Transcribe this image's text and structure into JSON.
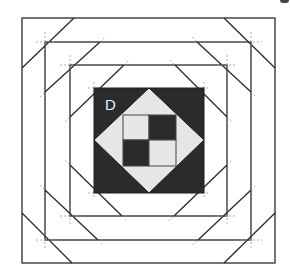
{
  "diagram": {
    "block_label": "D",
    "colors": {
      "background": "#ffffff",
      "line": "#2a2a2a",
      "dark_fabric": "#2b2b2b",
      "light_fabric": "#e6e6e6",
      "guide": "#8a8a8a"
    },
    "center": {
      "x": 149,
      "y": 140
    },
    "squares": [
      {
        "name": "outer-border",
        "left": 22,
        "top": 18,
        "right": 275,
        "bottom": 263
      },
      {
        "name": "second-border",
        "left": 45,
        "top": 42,
        "right": 251,
        "bottom": 240
      },
      {
        "name": "third-border",
        "left": 70,
        "top": 65,
        "right": 227,
        "bottom": 216
      },
      {
        "name": "dark-center-square",
        "left": 94,
        "top": 88,
        "right": 204,
        "bottom": 193
      }
    ],
    "diamond": {
      "top": [
        149,
        88
      ],
      "right": [
        204,
        140
      ],
      "bottom": [
        149,
        193
      ],
      "left": [
        94,
        140
      ]
    },
    "four_patch": {
      "left": 123,
      "top": 115,
      "right": 176,
      "bottom": 166,
      "cells": [
        "light",
        "dark",
        "dark",
        "light"
      ]
    }
  }
}
